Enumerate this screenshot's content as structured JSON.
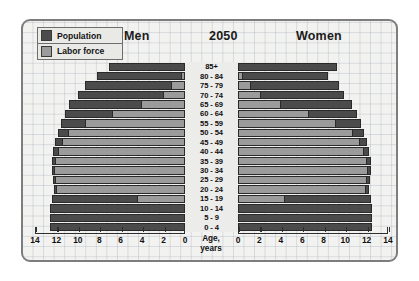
{
  "header": {
    "men": "Men",
    "year": "2050",
    "women": "Women"
  },
  "legend": {
    "items": [
      {
        "label": "Population",
        "color": "#4b4b4b",
        "key": "population"
      },
      {
        "label": "Labor force",
        "color": "#9b9b9b",
        "key": "labor_force"
      }
    ]
  },
  "axis": {
    "title_line1": "Age,",
    "title_line2": "years",
    "left_ticks": [
      "14",
      "12",
      "10",
      "8",
      "6",
      "4",
      "2",
      "0"
    ],
    "right_ticks": [
      "0",
      "2",
      "4",
      "6",
      "8",
      "10",
      "12",
      "14"
    ],
    "max": 14,
    "step": 2
  },
  "chart_data": {
    "type": "bar",
    "subtype": "population-pyramid",
    "title": "2050",
    "xlabel": "Age, years",
    "ylabel": "",
    "xlim": [
      0,
      14
    ],
    "grid": true,
    "legend_position": "top-left",
    "categories": [
      "85+",
      "80 - 84",
      "75 - 79",
      "70 - 74",
      "65 - 69",
      "60 - 64",
      "55 - 59",
      "50 - 54",
      "45 - 49",
      "40 - 44",
      "35 - 39",
      "30 - 34",
      "25 - 29",
      "20 - 24",
      "15 - 19",
      "10 - 14",
      "5 - 9",
      "0 - 4"
    ],
    "series": [
      {
        "name": "Men",
        "side": "left",
        "population": [
          7.1,
          8.2,
          9.3,
          10.0,
          10.8,
          11.2,
          11.6,
          11.9,
          12.1,
          12.3,
          12.4,
          12.4,
          12.3,
          12.2,
          12.4,
          12.6,
          12.6,
          12.6
        ],
        "labor_force": [
          0.0,
          0.4,
          1.3,
          2.1,
          4.1,
          6.8,
          9.3,
          10.9,
          11.5,
          11.9,
          12.1,
          12.2,
          12.1,
          12.0,
          4.5,
          0.0,
          0.0,
          0.0
        ]
      },
      {
        "name": "Women",
        "side": "right",
        "population": [
          9.2,
          8.4,
          9.4,
          9.9,
          10.6,
          11.1,
          11.5,
          11.8,
          12.0,
          12.2,
          12.4,
          12.4,
          12.3,
          12.2,
          12.4,
          12.5,
          12.5,
          12.5
        ],
        "labor_force": [
          0.0,
          0.5,
          1.2,
          2.1,
          4.0,
          6.6,
          9.1,
          10.7,
          11.4,
          11.8,
          12.0,
          12.1,
          12.0,
          11.9,
          4.4,
          0.0,
          0.0,
          0.0
        ]
      }
    ]
  }
}
